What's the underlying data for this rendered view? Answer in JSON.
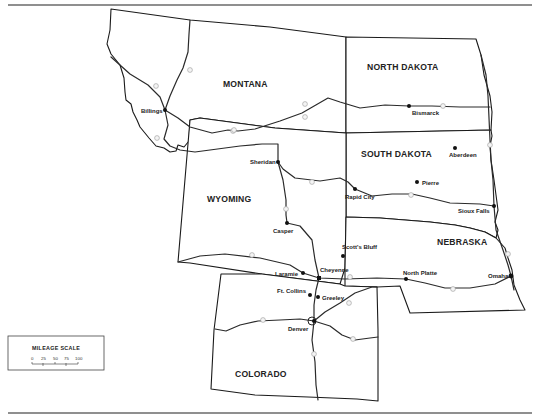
{
  "map": {
    "title": "Northern Great Plains region map",
    "states": [
      {
        "name": "MONTANA",
        "x": 258,
        "y": 84
      },
      {
        "name": "NORTH DAKOTA",
        "x": 388,
        "y": 68
      },
      {
        "name": "SOUTH DAKOTA",
        "x": 382,
        "y": 155
      },
      {
        "name": "WYOMING",
        "x": 228,
        "y": 200
      },
      {
        "name": "NEBRASKA",
        "x": 459,
        "y": 243
      },
      {
        "name": "COLORADO",
        "x": 280,
        "y": 375
      }
    ],
    "cities": [
      {
        "name": "Billings",
        "dot_x": 165,
        "dot_y": 110,
        "label_x": 141,
        "label_y": 113
      },
      {
        "name": "Bismarck",
        "dot_x": 409,
        "dot_y": 106,
        "label_x": 412,
        "label_y": 115
      },
      {
        "name": "Aberdeen",
        "dot_x": 455,
        "dot_y": 148,
        "label_x": 451,
        "label_y": 157
      },
      {
        "name": "Sheridan",
        "dot_x": 278,
        "dot_y": 162,
        "label_x": 250,
        "label_y": 164
      },
      {
        "name": "Rapid City",
        "dot_x": 355,
        "dot_y": 189,
        "label_x": 345,
        "label_y": 198
      },
      {
        "name": "Pierre",
        "dot_x": 417,
        "dot_y": 182,
        "label_x": 421,
        "label_y": 184
      },
      {
        "name": "Casper",
        "dot_x": 287,
        "dot_y": 223,
        "label_x": 273,
        "label_y": 232
      },
      {
        "name": "Sioux Falls",
        "dot_x": 494,
        "dot_y": 206,
        "label_x": 458,
        "label_y": 212
      },
      {
        "name": "Scott's Bluff",
        "dot_x": 343,
        "dot_y": 256,
        "label_x": 341,
        "label_y": 249
      },
      {
        "name": "Laramie",
        "dot_x": 303,
        "dot_y": 273,
        "label_x": 275,
        "label_y": 275
      },
      {
        "name": "Cheyenne",
        "dot_x": 319,
        "dot_y": 278,
        "label_x": 320,
        "label_y": 272
      },
      {
        "name": "North Platte",
        "dot_x": 406,
        "dot_y": 279,
        "label_x": 403,
        "label_y": 274
      },
      {
        "name": "Omaha",
        "dot_x": 511,
        "dot_y": 276,
        "label_x": 488,
        "label_y": 277
      },
      {
        "name": "Ft. Collins",
        "dot_x": 310,
        "dot_y": 295,
        "label_x": 276,
        "label_y": 293
      },
      {
        "name": "Greeley",
        "dot_x": 318,
        "dot_y": 297,
        "label_x": 322,
        "label_y": 300
      },
      {
        "name": "Denver",
        "dot_x": 314,
        "dot_y": 321,
        "label_x": 287,
        "label_y": 331
      }
    ],
    "interstates": [
      "I-94",
      "I-90",
      "I-25",
      "I-80",
      "I-70",
      "I-29",
      "I-76",
      "I-15"
    ]
  },
  "legend": {
    "title": "MILEAGE SCALE",
    "ticks": [
      "0",
      "25",
      "50",
      "75",
      "100"
    ],
    "unit": "miles"
  }
}
